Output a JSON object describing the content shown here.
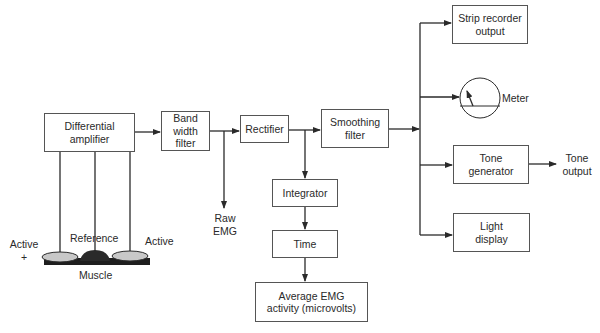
{
  "diagram": {
    "blocks": {
      "differential_amplifier": "Differential\namplifier",
      "band_width_filter": "Band\nwidth\nfilter",
      "rectifier": "Rectifier",
      "smoothing_filter": "Smoothing\nfilter",
      "integrator": "Integrator",
      "time": "Time",
      "average_emg": "Average EMG\nactivity (microvolts)",
      "strip_recorder": "Strip recorder\noutput",
      "tone_generator": "Tone\ngenerator",
      "light_display": "Light\ndisplay"
    },
    "labels": {
      "raw_emg": "Raw\nEMG",
      "meter": "Meter",
      "tone_output": "Tone\noutput",
      "active_left": "Active\n+",
      "reference": "Reference",
      "active_right": "Active",
      "muscle": "Muscle"
    },
    "connections": [
      [
        "differential_amplifier",
        "band_width_filter"
      ],
      [
        "band_width_filter",
        "rectifier"
      ],
      [
        "band_width_filter",
        "raw_emg"
      ],
      [
        "rectifier",
        "smoothing_filter"
      ],
      [
        "rectifier",
        "integrator"
      ],
      [
        "integrator",
        "time"
      ],
      [
        "time",
        "average_emg"
      ],
      [
        "smoothing_filter",
        "strip_recorder"
      ],
      [
        "smoothing_filter",
        "meter"
      ],
      [
        "smoothing_filter",
        "tone_generator"
      ],
      [
        "smoothing_filter",
        "light_display"
      ],
      [
        "tone_generator",
        "tone_output"
      ]
    ],
    "colors": {
      "line": "#2a2a2a",
      "box_border": "#555555",
      "electrode_fill": "#c8c8c8",
      "reference_fill": "#2a2a2a",
      "muscle_fill": "#1e1e1e"
    }
  }
}
